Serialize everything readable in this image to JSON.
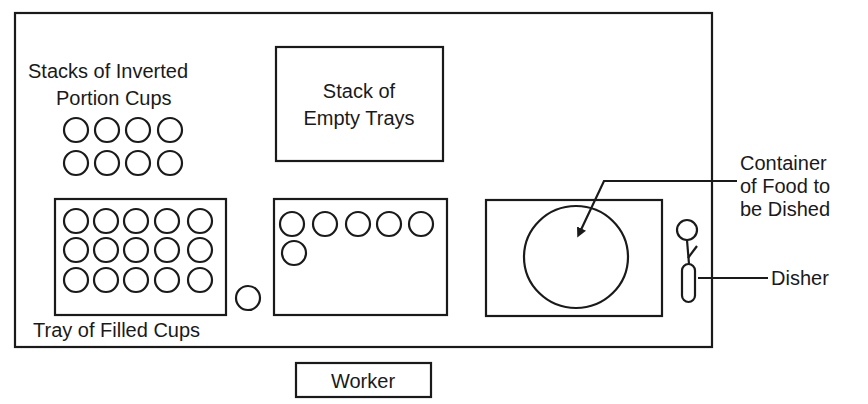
{
  "diagram": {
    "labels": {
      "inverted_cups_line1": "Stacks of Inverted",
      "inverted_cups_line2": "Portion Cups",
      "empty_trays_line1": "Stack of",
      "empty_trays_line2": "Empty Trays",
      "filled_tray": "Tray of Filled Cups",
      "container_line1": "Container",
      "container_line2": "of Food to",
      "container_line3": "be Dished",
      "disher": "Disher",
      "worker": "Worker"
    },
    "counts": {
      "inverted_cup_stacks": 8,
      "inverted_cup_rows": 2,
      "inverted_cup_cols": 4,
      "filled_cups": 15,
      "filled_cup_rows": 3,
      "filled_cup_cols": 5,
      "loose_cups": 1,
      "cups_in_working_tray": 6
    },
    "colors": {
      "line": "#1a1a1a",
      "background": "#ffffff"
    }
  }
}
